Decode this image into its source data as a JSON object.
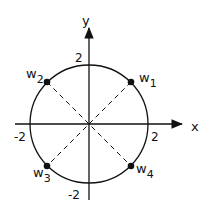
{
  "diagram": {
    "title": "",
    "axes": {
      "x_label": "x",
      "y_label": "y",
      "tick_labels": {
        "x_pos": "2",
        "x_neg": "-2",
        "y_pos": "2",
        "y_neg": "-2"
      }
    },
    "circle": {
      "radius": 2,
      "center": [
        0,
        0
      ]
    },
    "points": [
      {
        "label": "w",
        "sub": "1",
        "x": 1.414,
        "y": 1.414
      },
      {
        "label": "w",
        "sub": "2",
        "x": -1.414,
        "y": 1.414
      },
      {
        "label": "w",
        "sub": "3",
        "x": -1.414,
        "y": -1.414
      },
      {
        "label": "w",
        "sub": "4",
        "x": 1.414,
        "y": -1.414
      }
    ],
    "lines": [
      {
        "from": "w1",
        "to": "w3",
        "style": "dashed"
      },
      {
        "from": "w2",
        "to": "w4",
        "style": "dashed"
      }
    ]
  }
}
